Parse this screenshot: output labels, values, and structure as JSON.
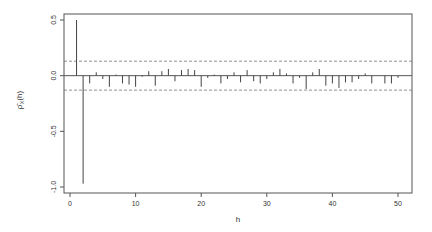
{
  "chart_data": {
    "type": "bar",
    "subtype": "acf-stem",
    "title": "",
    "xlabel": "h",
    "ylabel": "ρ̂X(h)",
    "ylabel_parts": {
      "main": "ρ̂",
      "sub": "X",
      "suffix": "(h)"
    },
    "xlim": [
      -1.5,
      52
    ],
    "ylim": [
      -1.02,
      0.57
    ],
    "x_ticks": [
      0,
      10,
      20,
      30,
      40,
      50
    ],
    "x_tick_labels": [
      "0",
      "10",
      "20",
      "30",
      "40",
      "50"
    ],
    "y_ticks": [
      -1.0,
      -0.5,
      0.0,
      0.5
    ],
    "y_tick_labels": [
      "-1.0",
      "-0.5",
      "0.0",
      "0.5"
    ],
    "confidence_band": 0.13,
    "zero_line": true,
    "grid": false,
    "legend": null,
    "x": [
      1,
      2,
      3,
      4,
      5,
      6,
      7,
      8,
      9,
      10,
      11,
      12,
      13,
      14,
      15,
      16,
      17,
      18,
      19,
      20,
      21,
      22,
      23,
      24,
      25,
      26,
      27,
      28,
      29,
      30,
      31,
      32,
      33,
      34,
      35,
      36,
      37,
      38,
      39,
      40,
      41,
      42,
      43,
      44,
      45,
      46,
      47,
      48,
      49,
      50
    ],
    "values": [
      0.5,
      -0.97,
      -0.07,
      0.03,
      -0.03,
      -0.1,
      0.01,
      -0.07,
      -0.08,
      -0.1,
      -0.01,
      0.04,
      -0.09,
      0.04,
      0.06,
      -0.05,
      0.05,
      0.06,
      0.05,
      -0.1,
      -0.02,
      0.01,
      -0.07,
      -0.03,
      0.03,
      -0.06,
      0.05,
      -0.05,
      -0.07,
      -0.03,
      0.03,
      0.06,
      0.02,
      -0.07,
      -0.02,
      -0.12,
      0.03,
      0.06,
      -0.09,
      -0.07,
      -0.11,
      -0.06,
      -0.06,
      -0.03,
      0.02,
      -0.07,
      0.0,
      -0.07,
      -0.07,
      -0.02
    ]
  },
  "colors": {
    "axis": "#555555",
    "bars": "#444444",
    "band": "#777777",
    "background": "#ffffff"
  }
}
